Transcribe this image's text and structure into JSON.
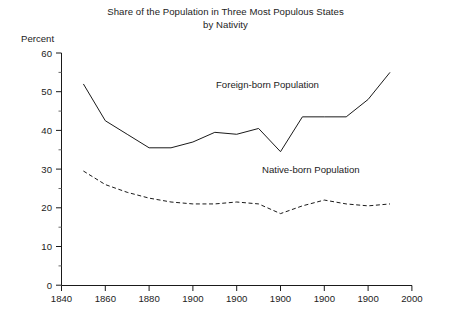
{
  "chart_data": {
    "type": "line",
    "title": "Share of the Population in Three Most Populous States by Nativity",
    "title_line1": "Share of the Population in Three Most Populous States",
    "title_line2": "by Nativity",
    "ylabel": "Percent",
    "xlabel": "",
    "ylim": [
      0,
      60
    ],
    "xlim": [
      1840,
      2000
    ],
    "grid": false,
    "legend_position": "inline-annotation",
    "y_ticks": [
      0,
      10,
      20,
      30,
      40,
      50,
      60
    ],
    "y_tick_labels": [
      "0",
      "10",
      "20",
      "30",
      "40",
      "50",
      "60"
    ],
    "y_minor_ticks": [
      5,
      15,
      25,
      35,
      45,
      55
    ],
    "x_ticks": [
      1840,
      1860,
      1880,
      1900,
      1920,
      1940,
      1960,
      1980,
      2000
    ],
    "x_tick_labels": [
      "1840",
      "1860",
      "1880",
      "1900",
      "1900",
      "1900",
      "1900",
      "1900",
      "2000"
    ],
    "series": [
      {
        "name": "Foreign-born Population",
        "style": "solid",
        "color": "#1a1a1a",
        "x": [
          1850,
          1860,
          1870,
          1880,
          1890,
          1900,
          1910,
          1920,
          1930,
          1940,
          1950,
          1960,
          1970,
          1980,
          1990
        ],
        "values": [
          52.0,
          42.5,
          39.0,
          35.5,
          35.5,
          37.0,
          39.5,
          39.0,
          40.5,
          34.5,
          43.5,
          43.5,
          43.5,
          48.0,
          55.0
        ]
      },
      {
        "name": "Native-born Population",
        "style": "dashed",
        "color": "#1a1a1a",
        "x": [
          1850,
          1860,
          1870,
          1880,
          1890,
          1900,
          1910,
          1920,
          1930,
          1940,
          1950,
          1960,
          1970,
          1980,
          1990
        ],
        "values": [
          29.5,
          26.0,
          24.0,
          22.5,
          21.5,
          21.0,
          21.0,
          21.5,
          21.0,
          18.5,
          20.5,
          22.0,
          21.0,
          20.5,
          21.0
        ]
      }
    ],
    "annotations": [
      {
        "text": "Foreign-born Population",
        "x": 1918,
        "y": 48
      },
      {
        "text": "Native-born Population",
        "x": 1938,
        "y": 26
      }
    ]
  }
}
